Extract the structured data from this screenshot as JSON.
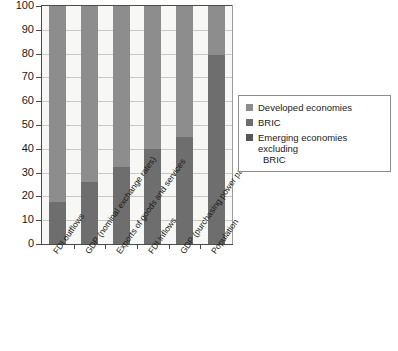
{
  "chart_data": {
    "type": "bar",
    "stacked": true,
    "stack_mode": "percent",
    "title": "",
    "subtitle": "",
    "xlabel": "",
    "ylabel": "",
    "ylim": [
      0,
      100
    ],
    "yticks": [
      0,
      10,
      20,
      30,
      40,
      50,
      60,
      70,
      80,
      90,
      100
    ],
    "ytick_labels": [
      "0",
      "10",
      "20",
      "30",
      "40",
      "50",
      "60",
      "70",
      "80",
      "90",
      "100"
    ],
    "grid": true,
    "grid_axis": "y",
    "legend_position": "right",
    "categories": [
      "FDI outflows",
      "GDP (nominal exchange rates)",
      "Exports of goods and services",
      "FDI inflows",
      "GDP (purchasing power parity)",
      "Population"
    ],
    "series": [
      {
        "name": "Emerging economies excluding BRIC",
        "color": "#575757",
        "values": [
          0,
          0,
          0,
          0,
          0,
          0
        ]
      },
      {
        "name": "BRIC",
        "color": "#6e6e6e",
        "values": [
          17.5,
          26,
          32.5,
          40,
          45,
          79.5
        ]
      },
      {
        "name": "Developed economies",
        "color": "#8d8d8d",
        "values": [
          82.5,
          74,
          67.5,
          60,
          55,
          20.5
        ]
      }
    ],
    "legend_entries": [
      {
        "label": "Developed economies",
        "color": "#8d8d8d"
      },
      {
        "label": "BRIC",
        "color": "#6e6e6e"
      },
      {
        "label": "Emerging economies excluding",
        "label_wrap": "BRIC",
        "color": "#575757"
      }
    ],
    "colors": {
      "developed": "#8d8d8d",
      "bric": "#6e6e6e",
      "emerging_excl_bric": "#575757",
      "plot_background": "#f7f7f5",
      "gridline": "#c9c9c7",
      "axis": "#4a4a4a"
    }
  }
}
